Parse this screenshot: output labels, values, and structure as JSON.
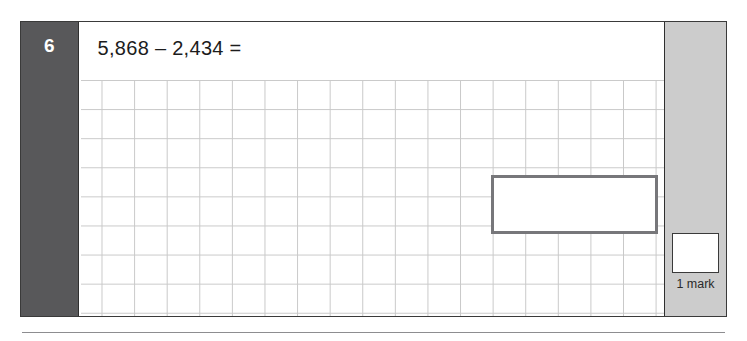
{
  "question": {
    "number": "6",
    "text": "5,868 – 2,434 =",
    "answer_value": "",
    "answer_placeholder": ""
  },
  "marks": {
    "box_value": "",
    "label": "1 mark"
  },
  "colors": {
    "number_column_bg": "#58585a",
    "mark_column_bg": "#cccccc",
    "frame_border": "#3a3a3a",
    "answer_box_border": "#77777a",
    "grid_line": "#c9c9c9",
    "page_bg": "#ffffff",
    "text": "#1c1c1c"
  }
}
